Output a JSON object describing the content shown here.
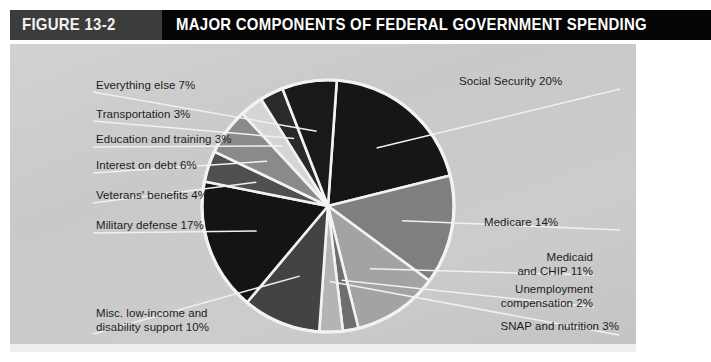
{
  "header": {
    "figure_number": "FIGURE 13-2",
    "title": "MAJOR COMPONENTS OF FEDERAL GOVERNMENT SPENDING",
    "figure_box_color": "#3c3c3c",
    "title_bar_color": "#050505",
    "text_color": "#ffffff"
  },
  "panel": {
    "background_color": "#cccccc",
    "leader_line_color": "#f0f0f0",
    "slice_outline_color": "#f2f2f2"
  },
  "chart_data": {
    "type": "pie",
    "title": "MAJOR COMPONENTS OF FEDERAL GOVERNMENT SPENDING",
    "xlabel": "",
    "ylabel": "",
    "units": "percent of federal spending",
    "total": 100,
    "start_angle_deg": -86,
    "direction": "clockwise",
    "center": {
      "x": 328,
      "y": 206
    },
    "radius": 126,
    "legend": "none (direct labels with leader lines)",
    "grid": false,
    "categories": [
      "Social Security",
      "Medicare",
      "Medicaid and CHIP",
      "Unemployment compensation",
      "SNAP and nutrition",
      "Misc. low-income and disability support",
      "Military defense",
      "Veterans' benefits",
      "Interest on debt",
      "Education and training",
      "Transportation",
      "Everything else"
    ],
    "values": [
      20,
      14,
      11,
      2,
      3,
      10,
      17,
      4,
      6,
      3,
      3,
      7
    ],
    "slices": [
      {
        "label": "Social Security",
        "label_text": "Social Security 20%",
        "value": 20,
        "color": "#161616"
      },
      {
        "label": "Medicare",
        "label_text": "Medicare 14%",
        "value": 14,
        "color": "#7f7f7f"
      },
      {
        "label": "Medicaid and CHIP",
        "label_text": "Medicaid and CHIP 11%",
        "value": 11,
        "color": "#a3a3a3"
      },
      {
        "label": "Unemployment compensation",
        "label_text": "Unemployment compensation 2%",
        "value": 2,
        "color": "#6e6e6e"
      },
      {
        "label": "SNAP and nutrition",
        "label_text": "SNAP and nutrition 3%",
        "value": 3,
        "color": "#b4b4b4"
      },
      {
        "label": "Misc. low-income and disability support",
        "label_text": "Misc. low-income and disability support 10%",
        "value": 10,
        "color": "#434343"
      },
      {
        "label": "Military defense",
        "label_text": "Military defense 17%",
        "value": 17,
        "color": "#141414"
      },
      {
        "label": "Veterans' benefits",
        "label_text": "Veterans' benefits 4%",
        "value": 4,
        "color": "#4f4f4f"
      },
      {
        "label": "Interest on debt",
        "label_text": "Interest on debt 6%",
        "value": 6,
        "color": "#8a8a8a"
      },
      {
        "label": "Education and training",
        "label_text": "Education and training 3%",
        "value": 3,
        "color": "#d5d5d5"
      },
      {
        "label": "Transportation",
        "label_text": "Transportation 3%",
        "value": 3,
        "color": "#2a2a2a"
      },
      {
        "label": "Everything else",
        "label_text": "Everything else 7%",
        "value": 7,
        "color": "#191919"
      }
    ]
  },
  "labels": {
    "social_security": {
      "line1": "Social Security 20%"
    },
    "medicare": {
      "line1": "Medicare 14%"
    },
    "medicaid": {
      "line1": "Medicaid",
      "line2": "and CHIP 11%"
    },
    "unemployment": {
      "line1": "Unemployment",
      "line2": "compensation 2%"
    },
    "snap": {
      "line1": "SNAP and nutrition 3%"
    },
    "misc_low_income": {
      "line1": "Misc. low-income and",
      "line2": "disability support 10%"
    },
    "military_defense": {
      "line1": "Military defense 17%"
    },
    "veterans_benefits": {
      "line1": "Veterans' benefits 4%"
    },
    "interest_on_debt": {
      "line1": "Interest on debt 6%"
    },
    "education_training": {
      "line1": "Education and training 3%"
    },
    "transportation": {
      "line1": "Transportation 3%"
    },
    "everything_else": {
      "line1": "Everything else 7%"
    }
  }
}
